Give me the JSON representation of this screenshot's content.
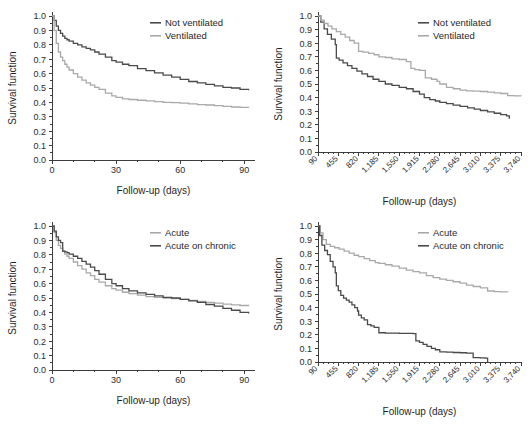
{
  "figure": {
    "panel_count": 4,
    "background": "#ffffff",
    "colors": {
      "dark_series": "#4a4a4a",
      "light_series": "#a9a9a9",
      "axis": "#3d3d3d",
      "text": "#1f1f1f"
    }
  },
  "chart_data": [
    {
      "id": "top-left",
      "type": "line",
      "title": "",
      "xlabel": "Follow-up (days)",
      "ylabel": "Survival function",
      "xlim": [
        0,
        95
      ],
      "ylim": [
        0,
        1
      ],
      "xticks": [
        "0",
        "30",
        "60",
        "90"
      ],
      "xtick_values": [
        0,
        30,
        60,
        90
      ],
      "yticks": [
        "0.0",
        "0.1",
        "0.2",
        "0.3",
        "0.4",
        "0.5",
        "0.6",
        "0.7",
        "0.8",
        "0.9",
        "1.0"
      ],
      "ytick_values": [
        0.0,
        0.1,
        0.2,
        0.3,
        0.4,
        0.5,
        0.6,
        0.7,
        0.8,
        0.9,
        1.0
      ],
      "grid": false,
      "legend_position": "top-right",
      "series": [
        {
          "name": "Not ventilated",
          "color": "#4a4a4a",
          "x": [
            0,
            1,
            2,
            3,
            4,
            5,
            6,
            7,
            8,
            10,
            12,
            14,
            16,
            18,
            20,
            22,
            25,
            28,
            30,
            33,
            36,
            40,
            44,
            48,
            52,
            56,
            60,
            64,
            68,
            72,
            76,
            80,
            84,
            88,
            92
          ],
          "values": [
            1.0,
            0.97,
            0.93,
            0.9,
            0.88,
            0.86,
            0.845,
            0.835,
            0.825,
            0.81,
            0.8,
            0.785,
            0.775,
            0.765,
            0.75,
            0.735,
            0.715,
            0.69,
            0.68,
            0.665,
            0.655,
            0.635,
            0.62,
            0.605,
            0.59,
            0.575,
            0.56,
            0.545,
            0.535,
            0.525,
            0.515,
            0.505,
            0.5,
            0.49,
            0.485
          ]
        },
        {
          "name": "Ventilated",
          "color": "#a9a9a9",
          "x": [
            0,
            1,
            2,
            3,
            4,
            5,
            6,
            7,
            8,
            10,
            12,
            14,
            16,
            18,
            20,
            22,
            25,
            28,
            30,
            33,
            36,
            40,
            44,
            48,
            52,
            56,
            60,
            64,
            68,
            72,
            76,
            80,
            84,
            88,
            92
          ],
          "values": [
            1.0,
            0.9,
            0.81,
            0.75,
            0.715,
            0.69,
            0.665,
            0.645,
            0.625,
            0.6,
            0.575,
            0.555,
            0.535,
            0.52,
            0.505,
            0.49,
            0.465,
            0.445,
            0.435,
            0.425,
            0.42,
            0.415,
            0.41,
            0.405,
            0.4,
            0.398,
            0.395,
            0.39,
            0.385,
            0.382,
            0.378,
            0.372,
            0.368,
            0.365,
            0.362
          ]
        }
      ]
    },
    {
      "id": "top-right",
      "type": "line",
      "title": "",
      "xlabel": "Follow-up (days)",
      "ylabel": "Survival function",
      "xlim": [
        90,
        3740
      ],
      "ylim": [
        0,
        1
      ],
      "xticks": [
        "90",
        "455",
        "820",
        "1,185",
        "1,550",
        "1,915",
        "2,280",
        "2,645",
        "3,010",
        "3,375",
        "3,740"
      ],
      "xtick_values": [
        90,
        455,
        820,
        1185,
        1550,
        1915,
        2280,
        2645,
        3010,
        3375,
        3740
      ],
      "yticks": [
        "0.0",
        "0.1",
        "0.2",
        "0.3",
        "0.4",
        "0.5",
        "0.6",
        "0.7",
        "0.8",
        "0.9",
        "1.0"
      ],
      "ytick_values": [
        0.0,
        0.1,
        0.2,
        0.3,
        0.4,
        0.5,
        0.6,
        0.7,
        0.8,
        0.9,
        1.0
      ],
      "grid": false,
      "legend_position": "top-right",
      "series": [
        {
          "name": "Not ventilated",
          "color": "#4a4a4a",
          "x": [
            90,
            140,
            200,
            260,
            330,
            400,
            420,
            470,
            540,
            620,
            700,
            790,
            880,
            980,
            1080,
            1185,
            1300,
            1420,
            1550,
            1680,
            1800,
            1915,
            2000,
            2100,
            2200,
            2280,
            2400,
            2520,
            2645,
            2780,
            2900,
            3010,
            3140,
            3260,
            3375,
            3480,
            3530
          ],
          "values": [
            1.0,
            0.955,
            0.905,
            0.865,
            0.83,
            0.79,
            0.69,
            0.675,
            0.655,
            0.635,
            0.615,
            0.595,
            0.575,
            0.555,
            0.535,
            0.52,
            0.5,
            0.49,
            0.475,
            0.465,
            0.445,
            0.425,
            0.4,
            0.385,
            0.375,
            0.365,
            0.355,
            0.345,
            0.335,
            0.325,
            0.315,
            0.305,
            0.295,
            0.285,
            0.275,
            0.265,
            0.245
          ]
        },
        {
          "name": "Ventilated",
          "color": "#a9a9a9",
          "x": [
            90,
            140,
            200,
            270,
            340,
            420,
            500,
            580,
            660,
            740,
            820,
            900,
            1000,
            1100,
            1185,
            1300,
            1420,
            1550,
            1680,
            1760,
            1830,
            1915,
            2020,
            2130,
            2230,
            2280,
            2400,
            2520,
            2645,
            2760,
            2880,
            3010,
            3140,
            3260,
            3375,
            3500,
            3620,
            3740
          ],
          "values": [
            1.0,
            0.97,
            0.945,
            0.925,
            0.905,
            0.885,
            0.865,
            0.845,
            0.82,
            0.8,
            0.74,
            0.735,
            0.725,
            0.715,
            0.7,
            0.695,
            0.685,
            0.68,
            0.665,
            0.615,
            0.605,
            0.6,
            0.545,
            0.535,
            0.52,
            0.5,
            0.475,
            0.465,
            0.455,
            0.45,
            0.448,
            0.445,
            0.44,
            0.435,
            0.43,
            0.415,
            0.412,
            0.41
          ]
        }
      ]
    },
    {
      "id": "bottom-left",
      "type": "line",
      "title": "",
      "xlabel": "Follow-up (days)",
      "ylabel": "Survival function",
      "xlim": [
        0,
        95
      ],
      "ylim": [
        0,
        1
      ],
      "xticks": [
        "0",
        "30",
        "60",
        "90"
      ],
      "xtick_values": [
        0,
        30,
        60,
        90
      ],
      "yticks": [
        "0.0",
        "0.1",
        "0.2",
        "0.3",
        "0.4",
        "0.5",
        "0.6",
        "0.7",
        "0.8",
        "0.9",
        "1.0"
      ],
      "ytick_values": [
        0.0,
        0.1,
        0.2,
        0.3,
        0.4,
        0.5,
        0.6,
        0.7,
        0.8,
        0.9,
        1.0
      ],
      "grid": false,
      "legend_position": "top-right",
      "series": [
        {
          "name": "Acute",
          "color": "#a9a9a9",
          "x": [
            0,
            1,
            2,
            3,
            4,
            5,
            6,
            7,
            8,
            10,
            12,
            14,
            16,
            18,
            20,
            22,
            25,
            28,
            30,
            33,
            36,
            40,
            44,
            48,
            52,
            56,
            60,
            64,
            68,
            72,
            76,
            80,
            84,
            88,
            92
          ],
          "values": [
            1.0,
            0.955,
            0.9,
            0.865,
            0.845,
            0.825,
            0.805,
            0.79,
            0.775,
            0.75,
            0.725,
            0.7,
            0.675,
            0.655,
            0.63,
            0.61,
            0.585,
            0.565,
            0.555,
            0.54,
            0.53,
            0.52,
            0.51,
            0.505,
            0.5,
            0.495,
            0.49,
            0.483,
            0.477,
            0.47,
            0.465,
            0.458,
            0.452,
            0.448,
            0.445
          ]
        },
        {
          "name": "Acute on chronic",
          "color": "#4a4a4a",
          "x": [
            0,
            1,
            2,
            3,
            4,
            5,
            6,
            7,
            8,
            10,
            12,
            14,
            16,
            18,
            20,
            22,
            25,
            28,
            30,
            33,
            36,
            40,
            44,
            48,
            52,
            56,
            60,
            64,
            68,
            72,
            76,
            80,
            84,
            88,
            92
          ],
          "values": [
            1.0,
            0.965,
            0.925,
            0.9,
            0.885,
            0.825,
            0.82,
            0.815,
            0.805,
            0.79,
            0.775,
            0.755,
            0.735,
            0.715,
            0.69,
            0.665,
            0.63,
            0.6,
            0.585,
            0.565,
            0.55,
            0.535,
            0.525,
            0.515,
            0.505,
            0.5,
            0.49,
            0.48,
            0.47,
            0.455,
            0.443,
            0.428,
            0.415,
            0.4,
            0.392
          ]
        }
      ]
    },
    {
      "id": "bottom-right",
      "type": "line",
      "title": "",
      "xlabel": "Follow-up (days)",
      "ylabel": "Survival function",
      "xlim": [
        90,
        3740
      ],
      "ylim": [
        0,
        1
      ],
      "xticks": [
        "90",
        "455",
        "820",
        "1,185",
        "1,550",
        "1,915",
        "2,280",
        "2,645",
        "3,010",
        "3,375",
        "3,740"
      ],
      "xtick_values": [
        90,
        455,
        820,
        1185,
        1550,
        1915,
        2280,
        2645,
        3010,
        3375,
        3740
      ],
      "yticks": [
        "0.0",
        "0.1",
        "0.2",
        "0.3",
        "0.4",
        "0.5",
        "0.6",
        "0.7",
        "0.8",
        "0.9",
        "1.0"
      ],
      "ytick_values": [
        0.0,
        0.1,
        0.2,
        0.3,
        0.4,
        0.5,
        0.6,
        0.7,
        0.8,
        0.9,
        1.0
      ],
      "grid": false,
      "legend_position": "top-right",
      "series": [
        {
          "name": "Acute",
          "color": "#a9a9a9",
          "x": [
            90,
            130,
            180,
            240,
            310,
            390,
            470,
            560,
            650,
            740,
            820,
            920,
            1020,
            1120,
            1185,
            1300,
            1420,
            1550,
            1680,
            1800,
            1915,
            2040,
            2160,
            2280,
            2400,
            2520,
            2645,
            2760,
            2880,
            3010,
            3140,
            3260,
            3375,
            3500
          ],
          "values": [
            1.0,
            0.95,
            0.9,
            0.865,
            0.85,
            0.84,
            0.83,
            0.815,
            0.8,
            0.785,
            0.775,
            0.76,
            0.745,
            0.73,
            0.725,
            0.715,
            0.705,
            0.69,
            0.675,
            0.665,
            0.655,
            0.635,
            0.62,
            0.61,
            0.6,
            0.59,
            0.58,
            0.565,
            0.555,
            0.545,
            0.522,
            0.518,
            0.515,
            0.512
          ]
        },
        {
          "name": "Acute on chronic",
          "color": "#4a4a4a",
          "x": [
            90,
            120,
            160,
            210,
            260,
            310,
            360,
            400,
            420,
            455,
            500,
            550,
            600,
            650,
            700,
            750,
            800,
            820,
            870,
            920,
            980,
            1040,
            1100,
            1185,
            1300,
            1420,
            1550,
            1680,
            1800,
            1850,
            1915,
            1980,
            2050,
            2130,
            2200,
            2280,
            2400,
            2520,
            2645,
            2760,
            2880,
            3010,
            3090,
            3140
          ],
          "values": [
            1.0,
            0.93,
            0.86,
            0.82,
            0.79,
            0.74,
            0.7,
            0.655,
            0.56,
            0.525,
            0.49,
            0.47,
            0.455,
            0.44,
            0.42,
            0.4,
            0.375,
            0.345,
            0.325,
            0.31,
            0.275,
            0.265,
            0.255,
            0.215,
            0.213,
            0.212,
            0.211,
            0.21,
            0.208,
            0.155,
            0.145,
            0.13,
            0.115,
            0.1,
            0.09,
            0.075,
            0.072,
            0.07,
            0.068,
            0.065,
            0.032,
            0.03,
            0.028,
            0.0
          ]
        }
      ]
    }
  ]
}
